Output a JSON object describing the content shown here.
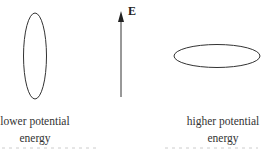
{
  "figure": {
    "field": {
      "label": "E",
      "direction": "up"
    },
    "left_dipole": {
      "orientation": "vertical",
      "caption_line1": "lower potential",
      "caption_line2": "energy"
    },
    "right_dipole": {
      "orientation": "horizontal",
      "caption_line1": "higher potential",
      "caption_line2": "energy"
    },
    "colors": {
      "stroke": "#333333",
      "text": "#333333"
    }
  }
}
